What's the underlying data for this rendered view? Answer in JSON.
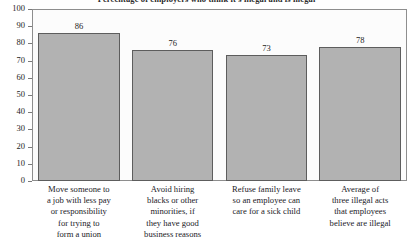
{
  "chart_data": {
    "type": "bar",
    "title": "Percentage of employers who think it's illegal and is illegal",
    "xlabel": "",
    "ylabel": "",
    "ylim": [
      0,
      100
    ],
    "yticks": [
      0,
      10,
      20,
      30,
      40,
      50,
      60,
      70,
      80,
      90,
      100
    ],
    "ytick_labels": [
      "0",
      "10",
      "20",
      "30",
      "40",
      "50",
      "60",
      "70",
      "80",
      "90",
      "100"
    ],
    "grid": false,
    "legend": null,
    "categories": [
      "Move someone to a job with less pay or responsibility for trying to form a union",
      "Avoid hiring blacks or other minorities, if they have good business reasons",
      "Refuse family leave so an employee can care for a sick child",
      "Average of three illegal acts that employees believe are illegal"
    ],
    "category_lines": [
      [
        "Move someone to",
        "a job with less pay",
        "or responsibility",
        "for trying to",
        "form a union"
      ],
      [
        "Avoid hiring",
        "blacks or other",
        "minorities, if",
        "they have good",
        "business reasons"
      ],
      [
        "Refuse family leave",
        "so an employee can",
        "care for a sick child"
      ],
      [
        "Average of",
        "three illegal acts",
        "that employees",
        "believe are illegal"
      ]
    ],
    "values": [
      86,
      76,
      73,
      78
    ],
    "value_labels": [
      "86",
      "76",
      "73",
      "78"
    ],
    "colors": {
      "bar_fill": "#b2b2b2",
      "bar_border": "#5d5d5d",
      "axis": "#8e8e8e",
      "text": "#1d1d1d",
      "background": "#ffffff",
      "plot_background": "#fcfcfc"
    }
  }
}
